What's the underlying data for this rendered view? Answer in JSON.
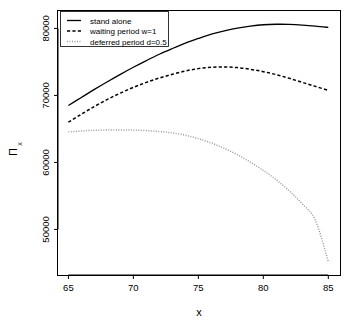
{
  "chart_data": {
    "type": "line",
    "title": "",
    "xlabel": "x",
    "ylabel": "Π",
    "ylabel_sub": "x",
    "xlim": [
      64.2,
      85.9
    ],
    "ylim": [
      43200,
      82600
    ],
    "xticks": [
      65,
      70,
      75,
      80,
      85
    ],
    "xtick_labels": [
      "65",
      "70",
      "75",
      "80",
      "85"
    ],
    "yticks": [
      50000,
      60000,
      70000,
      80000
    ],
    "ytick_labels": [
      "50000",
      "60000",
      "70000",
      "80000"
    ],
    "grid": false,
    "legend_position": "top-left",
    "x": [
      65,
      66,
      67,
      68,
      69,
      70,
      71,
      72,
      73,
      74,
      75,
      76,
      77,
      78,
      79,
      80,
      81,
      82,
      83,
      84,
      85
    ],
    "series": [
      {
        "name": "stand alone",
        "style": "solid",
        "color": "#000000",
        "values": [
          68500,
          69700,
          70900,
          72050,
          73150,
          74200,
          75200,
          76150,
          77000,
          77800,
          78500,
          79150,
          79650,
          80050,
          80350,
          80550,
          80620,
          80600,
          80500,
          80350,
          80150
        ]
      },
      {
        "name": "waiting period w=1",
        "style": "dashed",
        "color": "#000000",
        "values": [
          66000,
          67200,
          68350,
          69400,
          70350,
          71200,
          71950,
          72600,
          73150,
          73650,
          74000,
          74200,
          74250,
          74150,
          73900,
          73550,
          73100,
          72550,
          71950,
          71350,
          70750
        ]
      },
      {
        "name": "deferred period d=0.5",
        "style": "dotted",
        "color": "#9a9a9a",
        "values": [
          64550,
          64700,
          64800,
          64850,
          64850,
          64820,
          64750,
          64620,
          64400,
          64050,
          63550,
          62900,
          62100,
          61150,
          60050,
          58800,
          57400,
          55750,
          53800,
          51400,
          45200
        ]
      }
    ]
  },
  "legend": {
    "items": [
      {
        "label": "stand alone"
      },
      {
        "label": "waiting period w=1"
      },
      {
        "label": "deferred period d=0.5"
      }
    ]
  }
}
